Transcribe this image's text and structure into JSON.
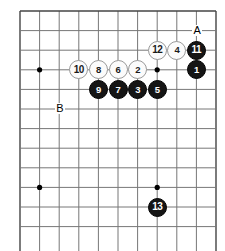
{
  "diagram": {
    "type": "go-board-diagram",
    "board": {
      "cell_size": 19.6,
      "origin_x": 20,
      "origin_y": 11,
      "cols": 11,
      "rows": 12,
      "line_color": "#777777",
      "edge_color": "#444444",
      "background": "#ffffff",
      "edges": {
        "top": true,
        "left": true,
        "right": true,
        "bottom": false
      },
      "star_points": [
        {
          "col": 1,
          "row": 3
        },
        {
          "col": 7,
          "row": 3
        },
        {
          "col": 1,
          "row": 9
        },
        {
          "col": 7,
          "row": 9
        }
      ]
    },
    "stones": [
      {
        "label": "1",
        "color": "black",
        "col": 9,
        "row": 3
      },
      {
        "label": "2",
        "color": "white",
        "col": 6,
        "row": 3
      },
      {
        "label": "3",
        "color": "black",
        "col": 6,
        "row": 4
      },
      {
        "label": "4",
        "color": "white",
        "col": 8,
        "row": 2
      },
      {
        "label": "5",
        "color": "black",
        "col": 7,
        "row": 4
      },
      {
        "label": "6",
        "color": "white",
        "col": 5,
        "row": 3
      },
      {
        "label": "7",
        "color": "black",
        "col": 5,
        "row": 4
      },
      {
        "label": "8",
        "color": "white",
        "col": 4,
        "row": 3
      },
      {
        "label": "9",
        "color": "black",
        "col": 4,
        "row": 4
      },
      {
        "label": "10",
        "color": "white",
        "col": 3,
        "row": 3
      },
      {
        "label": "11",
        "color": "black",
        "col": 9,
        "row": 2
      },
      {
        "label": "12",
        "color": "white",
        "col": 7,
        "row": 2
      },
      {
        "label": "13",
        "color": "black",
        "col": 7,
        "row": 10
      }
    ],
    "markers": [
      {
        "label": "A",
        "col": 9,
        "row": 1
      },
      {
        "label": "B",
        "col": 2,
        "row": 5
      }
    ],
    "colors": {
      "black_stone": "#151515",
      "white_stone": "#fbfbfb",
      "white_stone_border": "#9a9a9a",
      "grid": "#777777",
      "edge": "#444444"
    }
  }
}
